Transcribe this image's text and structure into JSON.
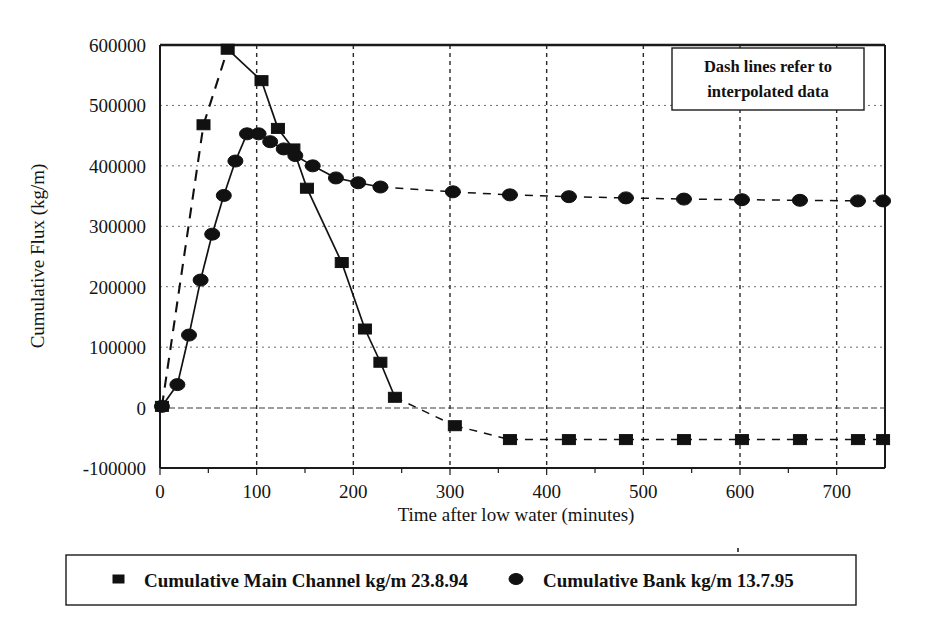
{
  "chart_data": {
    "type": "line",
    "title": "",
    "xlabel": "Time after low water (minutes)",
    "ylabel": "Cumulative Flux (kg/m)",
    "xlim": [
      0,
      750
    ],
    "ylim": [
      -100000,
      600000
    ],
    "xticks": [
      0,
      100,
      200,
      300,
      400,
      500,
      600,
      700
    ],
    "xtick_labels": [
      "0",
      "100",
      "200",
      "300",
      "400",
      "500",
      "600",
      "700"
    ],
    "yticks": [
      -100000,
      0,
      100000,
      200000,
      300000,
      400000,
      500000,
      600000
    ],
    "ytick_labels": [
      "-100000",
      "0",
      "100000",
      "200000",
      "300000",
      "400000",
      "500000",
      "600000"
    ],
    "grid": "both",
    "legend_position": "below-plot",
    "annotation": {
      "line1": "Dash lines refer to",
      "line2": "interpolated data"
    },
    "series": [
      {
        "name": "Cumulative Main Channel kg/m 23.8.94",
        "marker": "square",
        "color": "#111111",
        "points": [
          {
            "x": 2,
            "y": 2000,
            "interpolated_to_next": true
          },
          {
            "x": 45,
            "y": 468000,
            "interpolated_to_next": true
          },
          {
            "x": 70,
            "y": 593000,
            "interpolated_to_next": false
          },
          {
            "x": 105,
            "y": 541000,
            "interpolated_to_next": false
          },
          {
            "x": 122,
            "y": 462000,
            "interpolated_to_next": false
          },
          {
            "x": 138,
            "y": 428000,
            "interpolated_to_next": false
          },
          {
            "x": 152,
            "y": 363000,
            "interpolated_to_next": false
          },
          {
            "x": 188,
            "y": 240000,
            "interpolated_to_next": false
          },
          {
            "x": 212,
            "y": 130000,
            "interpolated_to_next": false
          },
          {
            "x": 228,
            "y": 75000,
            "interpolated_to_next": false
          },
          {
            "x": 243,
            "y": 17000,
            "interpolated_to_next": true
          },
          {
            "x": 305,
            "y": -30000,
            "interpolated_to_next": true
          },
          {
            "x": 362,
            "y": -53000,
            "interpolated_to_next": true
          },
          {
            "x": 423,
            "y": -53000,
            "interpolated_to_next": true
          },
          {
            "x": 482,
            "y": -53000,
            "interpolated_to_next": true
          },
          {
            "x": 542,
            "y": -53000,
            "interpolated_to_next": true
          },
          {
            "x": 602,
            "y": -53000,
            "interpolated_to_next": true
          },
          {
            "x": 662,
            "y": -53000,
            "interpolated_to_next": true
          },
          {
            "x": 722,
            "y": -53000,
            "interpolated_to_next": true
          },
          {
            "x": 748,
            "y": -53000,
            "interpolated_to_next": false
          }
        ]
      },
      {
        "name": "Cumulative Bank kg/m 13.7.95",
        "marker": "circle",
        "color": "#111111",
        "points": [
          {
            "x": 2,
            "y": 2000,
            "interpolated_to_next": false
          },
          {
            "x": 18,
            "y": 38000,
            "interpolated_to_next": false
          },
          {
            "x": 30,
            "y": 120000,
            "interpolated_to_next": false
          },
          {
            "x": 42,
            "y": 211000,
            "interpolated_to_next": false
          },
          {
            "x": 54,
            "y": 287000,
            "interpolated_to_next": false
          },
          {
            "x": 66,
            "y": 351000,
            "interpolated_to_next": false
          },
          {
            "x": 78,
            "y": 408000,
            "interpolated_to_next": false
          },
          {
            "x": 90,
            "y": 453000,
            "interpolated_to_next": false
          },
          {
            "x": 102,
            "y": 453000,
            "interpolated_to_next": false
          },
          {
            "x": 114,
            "y": 440000,
            "interpolated_to_next": false
          },
          {
            "x": 128,
            "y": 428000,
            "interpolated_to_next": false
          },
          {
            "x": 140,
            "y": 417000,
            "interpolated_to_next": false
          },
          {
            "x": 158,
            "y": 400000,
            "interpolated_to_next": false
          },
          {
            "x": 182,
            "y": 380000,
            "interpolated_to_next": false
          },
          {
            "x": 205,
            "y": 372000,
            "interpolated_to_next": false
          },
          {
            "x": 228,
            "y": 365000,
            "interpolated_to_next": true
          },
          {
            "x": 303,
            "y": 357000,
            "interpolated_to_next": true
          },
          {
            "x": 362,
            "y": 352000,
            "interpolated_to_next": true
          },
          {
            "x": 423,
            "y": 349000,
            "interpolated_to_next": true
          },
          {
            "x": 482,
            "y": 347000,
            "interpolated_to_next": true
          },
          {
            "x": 542,
            "y": 345000,
            "interpolated_to_next": true
          },
          {
            "x": 602,
            "y": 344000,
            "interpolated_to_next": true
          },
          {
            "x": 662,
            "y": 343000,
            "interpolated_to_next": true
          },
          {
            "x": 722,
            "y": 342000,
            "interpolated_to_next": true
          },
          {
            "x": 748,
            "y": 342000,
            "interpolated_to_next": false
          }
        ]
      }
    ]
  },
  "legend": {
    "items": [
      {
        "label": "Cumulative Main Channel kg/m 23.8.94",
        "marker": "square"
      },
      {
        "label": "Cumulative Bank kg/m 13.7.95",
        "marker": "circle"
      }
    ]
  }
}
